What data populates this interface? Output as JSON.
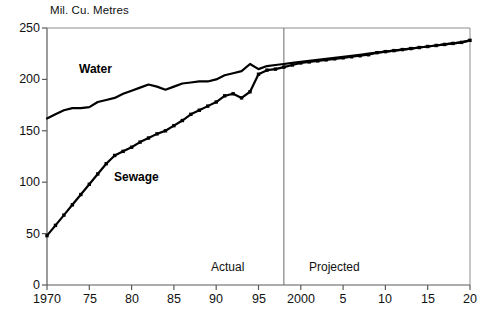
{
  "chart_data": {
    "type": "line",
    "title": "",
    "ylabel": "Mil. Cu. Metres",
    "xlabel": "",
    "xlim": [
      1970,
      2020
    ],
    "ylim": [
      0,
      250
    ],
    "grid": false,
    "legend_position": "inline-annotation",
    "y_ticks": [
      0,
      50,
      100,
      150,
      200,
      250
    ],
    "y_tick_labels": [
      "0",
      "50",
      "100",
      "150",
      "200",
      "250"
    ],
    "x_ticks": [
      1970,
      1975,
      1980,
      1985,
      1990,
      1995,
      2000,
      2005,
      2010,
      2015,
      2020
    ],
    "x_tick_labels": [
      "1970",
      "75",
      "80",
      "85",
      "90",
      "95",
      "2000",
      "5",
      "10",
      "15",
      "20"
    ],
    "annotations": [
      {
        "name": "actual-label",
        "text": "Actual",
        "x": 1991.0,
        "y": 22
      },
      {
        "name": "projected-label",
        "text": "Projected",
        "x": 2003.5,
        "y": 22
      },
      {
        "name": "divider",
        "text": "",
        "x": 1998.0
      }
    ],
    "divider_x": 1998.0,
    "x": [
      1970,
      1971,
      1972,
      1973,
      1974,
      1975,
      1976,
      1977,
      1978,
      1979,
      1980,
      1981,
      1982,
      1983,
      1984,
      1985,
      1986,
      1987,
      1988,
      1989,
      1990,
      1991,
      1992,
      1993,
      1994,
      1995,
      1996,
      1997,
      1998,
      1999,
      2000,
      2001,
      2002,
      2003,
      2004,
      2005,
      2006,
      2007,
      2008,
      2009,
      2010,
      2011,
      2012,
      2013,
      2014,
      2015,
      2016,
      2017,
      2018,
      2019,
      2020
    ],
    "series": [
      {
        "name": "Water",
        "marker": "none",
        "color": "#000000",
        "values": [
          162,
          166,
          170,
          172,
          172,
          173,
          178,
          180,
          182,
          186,
          189,
          192,
          195,
          193,
          190,
          193,
          196,
          197,
          198,
          198,
          200,
          204,
          206,
          208,
          215,
          210,
          213,
          214,
          215,
          216,
          217,
          218,
          219,
          220,
          221,
          222,
          223,
          224,
          225,
          226,
          227,
          228,
          229,
          230,
          231,
          232,
          233,
          234,
          235,
          236,
          238
        ]
      },
      {
        "name": "Sewage",
        "marker": "square",
        "color": "#000000",
        "values": [
          48,
          58,
          68,
          78,
          88,
          98,
          108,
          118,
          126,
          130,
          134,
          139,
          143,
          147,
          150,
          155,
          160,
          166,
          170,
          174,
          178,
          184,
          186,
          182,
          188,
          205,
          209,
          210,
          212,
          214,
          216,
          217,
          218,
          219,
          220,
          221,
          222,
          223,
          224,
          226,
          227,
          228,
          229,
          230,
          231,
          232,
          233,
          234,
          235,
          236,
          238
        ]
      }
    ]
  }
}
